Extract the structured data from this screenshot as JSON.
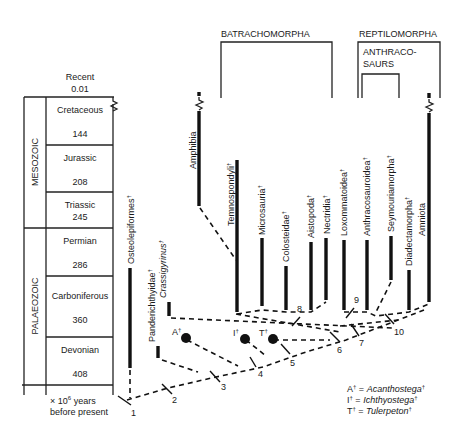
{
  "timescale": {
    "top_label": "Recent",
    "top_value": "0.01",
    "eras": [
      {
        "name": "MESOZOIC"
      },
      {
        "name": "PALAEOZOIC"
      }
    ],
    "periods": [
      {
        "name": "Cretaceous",
        "value": "144"
      },
      {
        "name": "Jurassic",
        "value": "208"
      },
      {
        "name": "Triassic",
        "value": "245"
      },
      {
        "name": "Permian",
        "value": "286"
      },
      {
        "name": "Carboniferous",
        "value": "360"
      },
      {
        "name": "Devonian",
        "value": "408"
      }
    ],
    "units_line1": "× 10",
    "units_exp": "6",
    "units_line1_suffix": " years",
    "units_line2": "before present"
  },
  "groups": {
    "batrachomorpha": "BATRACHOMORPHA",
    "reptilomorpha": "REPTILOMORPHA",
    "anthracosaurs_line1": "ANTHRACO-",
    "anthracosaurs_line2": "SAURS"
  },
  "taxa": [
    {
      "name": "Osteolepiformes",
      "dagger": "†"
    },
    {
      "name": "Panderichthyidae",
      "dagger": "†"
    },
    {
      "name": "Crassigyrinus",
      "dagger": "†",
      "italic": true
    },
    {
      "name": "Amphibia",
      "dagger": ""
    },
    {
      "name": "Temnospondyli",
      "dagger": "†"
    },
    {
      "name": "Microsauria",
      "dagger": "†"
    },
    {
      "name": "Colosteidae",
      "dagger": "†"
    },
    {
      "name": "Aistopoda",
      "dagger": "†"
    },
    {
      "name": "Nectridia",
      "dagger": "†"
    },
    {
      "name": "Loxommatoidea",
      "dagger": "†"
    },
    {
      "name": "Anthracosauroidea",
      "dagger": "†"
    },
    {
      "name": "Seymouriamorpha",
      "dagger": "†"
    },
    {
      "name": "Diadectamorpha",
      "dagger": "†"
    },
    {
      "name": "Amniota",
      "dagger": ""
    }
  ],
  "fossils": [
    {
      "letter": "A",
      "dagger": "†"
    },
    {
      "letter": "I",
      "dagger": "†"
    },
    {
      "letter": "T",
      "dagger": "†"
    }
  ],
  "nodes": [
    "1",
    "2",
    "3",
    "4",
    "5",
    "6",
    "7",
    "8",
    "9",
    "10"
  ],
  "legend": [
    {
      "key": "A",
      "dagger": "†",
      "eq": " = ",
      "genus": "Acanthostega",
      "genus_dagger": "†"
    },
    {
      "key": "I",
      "dagger": "†",
      "eq": " = ",
      "genus": "Ichthyostega",
      "genus_dagger": "†"
    },
    {
      "key": "T",
      "dagger": "†",
      "eq": " = ",
      "genus": "Tulerpeton",
      "genus_dagger": "†"
    }
  ]
}
